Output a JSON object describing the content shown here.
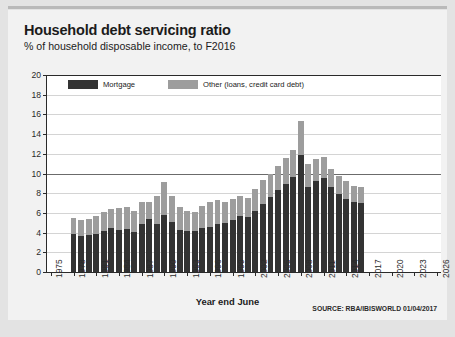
{
  "header": {
    "title": "Household debt servicing ratio",
    "subtitle": "% of household disposable income, to F2016"
  },
  "footer": {
    "xaxis_title": "Year end June",
    "source": "SOURCE: RBA/IBISWORLD 01/04/2017"
  },
  "chart_data": {
    "type": "bar",
    "title": "Household debt servicing ratio",
    "subtitle": "% of household disposable income, to F2016",
    "xlabel": "Year end June",
    "ylabel": "",
    "stacked": true,
    "grid": true,
    "legend_position": "top-left",
    "ylim": [
      0,
      20
    ],
    "yticks": [
      0,
      2,
      4,
      6,
      8,
      10,
      12,
      14,
      16,
      18,
      20
    ],
    "xlim": [
      1975,
      2026
    ],
    "xticks": [
      1975,
      1978,
      1981,
      1984,
      1987,
      1990,
      1993,
      1996,
      1999,
      2002,
      2005,
      2008,
      2011,
      2014,
      2017,
      2020,
      2023,
      2026
    ],
    "categories": [
      1978,
      1979,
      1980,
      1981,
      1982,
      1983,
      1984,
      1985,
      1986,
      1987,
      1988,
      1989,
      1990,
      1991,
      1992,
      1993,
      1994,
      1995,
      1996,
      1997,
      1998,
      1999,
      2000,
      2001,
      2002,
      2003,
      2004,
      2005,
      2006,
      2007,
      2008,
      2009,
      2010,
      2011,
      2012,
      2013,
      2014,
      2015,
      2016
    ],
    "series": [
      {
        "name": "Mortgage",
        "color": "#333333",
        "values": [
          3.9,
          3.7,
          3.8,
          3.9,
          4.2,
          4.5,
          4.3,
          4.4,
          4.1,
          4.9,
          5.4,
          4.9,
          5.8,
          5.1,
          4.3,
          4.2,
          4.2,
          4.5,
          4.6,
          4.9,
          5.0,
          5.3,
          5.7,
          5.6,
          6.2,
          6.9,
          7.6,
          8.3,
          8.9,
          9.6,
          11.9,
          8.6,
          9.2,
          9.5,
          8.6,
          7.9,
          7.4,
          7.1,
          7.0
        ]
      },
      {
        "name": "Other (loans, credit card debt)",
        "color": "#9d9d9d",
        "values": [
          1.6,
          1.6,
          1.6,
          1.8,
          1.9,
          1.9,
          2.2,
          2.2,
          2.1,
          2.2,
          1.7,
          2.8,
          3.3,
          2.6,
          2.3,
          2.0,
          1.9,
          2.2,
          2.5,
          2.4,
          2.1,
          2.1,
          2.0,
          1.9,
          2.2,
          2.4,
          2.4,
          2.5,
          2.7,
          2.8,
          3.4,
          2.4,
          2.3,
          2.2,
          1.9,
          1.8,
          1.8,
          1.6,
          1.6
        ]
      }
    ]
  }
}
